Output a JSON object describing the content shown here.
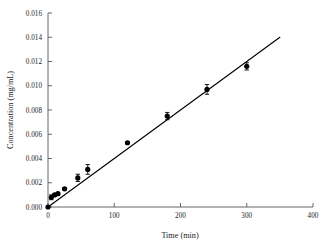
{
  "chart_data": {
    "type": "scatter",
    "title": "",
    "xlabel": "Time (min)",
    "ylabel": "Concentration (mg/mL)",
    "xlim": [
      0,
      400
    ],
    "ylim": [
      0.0,
      0.016
    ],
    "xticks": [
      0,
      100,
      200,
      300,
      400
    ],
    "yticks": [
      0.0,
      0.002,
      0.004,
      0.006,
      0.008,
      0.01,
      0.012,
      0.014,
      0.016
    ],
    "xtick_labels": [
      "0",
      "100",
      "200",
      "300",
      "400"
    ],
    "ytick_labels": [
      "0.000",
      "0.002",
      "0.004",
      "0.006",
      "0.008",
      "0.010",
      "0.012",
      "0.014",
      "0.016"
    ],
    "grid": false,
    "legend": null,
    "marker_style": "filled-circle",
    "marker_color": "#000000",
    "line_color": "#000000",
    "series": [
      {
        "name": "Concentration",
        "x": [
          0,
          5,
          10,
          15,
          25,
          45,
          60,
          120,
          180,
          240,
          300
        ],
        "y": [
          0.0,
          0.0008,
          0.001,
          0.0011,
          0.0015,
          0.0024,
          0.0031,
          0.0053,
          0.0075,
          0.0097,
          0.0116
        ],
        "yerr": [
          0.0,
          0.0002,
          0.0001,
          0.0001,
          0.0001,
          0.0003,
          0.0004,
          0.0001,
          0.0003,
          0.0004,
          0.0003
        ]
      }
    ],
    "fit_line": {
      "name": "linear-fit",
      "x": [
        0,
        350
      ],
      "y": [
        0.0,
        0.014
      ],
      "slope": 4e-05,
      "intercept": 0.0
    }
  }
}
